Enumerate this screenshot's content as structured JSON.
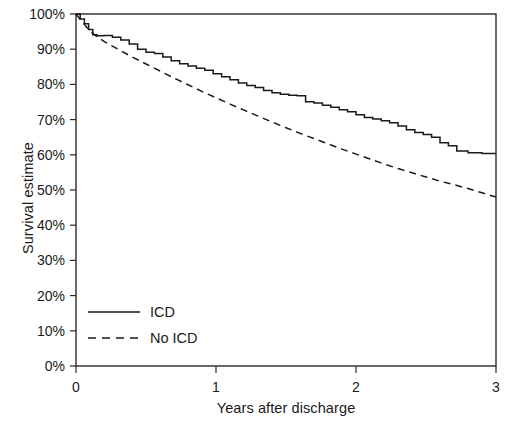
{
  "chart_data": {
    "type": "line",
    "title": "",
    "subtitle": "",
    "xlabel": "Years after discharge",
    "ylabel": "Survival estimate",
    "xlim": [
      0,
      3
    ],
    "ylim": [
      0,
      100
    ],
    "grid": false,
    "legend_position": "bottom-left",
    "xticks": [
      0,
      1,
      2,
      3
    ],
    "xtick_labels": [
      "0",
      "1",
      "2",
      "3"
    ],
    "yticks": [
      0,
      10,
      20,
      30,
      40,
      50,
      60,
      70,
      80,
      90,
      100
    ],
    "ytick_labels": [
      "0%",
      "10%",
      "20%",
      "30%",
      "40%",
      "50%",
      "60%",
      "70%",
      "80%",
      "90%",
      "100%"
    ],
    "series": [
      {
        "name": "ICD",
        "style": "solid",
        "color": "#1a1a1a",
        "x": [
          0.0,
          0.03,
          0.06,
          0.09,
          0.12,
          0.15,
          0.2,
          0.26,
          0.32,
          0.38,
          0.44,
          0.5,
          0.56,
          0.62,
          0.68,
          0.74,
          0.8,
          0.86,
          0.92,
          0.98,
          1.04,
          1.1,
          1.16,
          1.22,
          1.28,
          1.34,
          1.4,
          1.46,
          1.52,
          1.58,
          1.64,
          1.7,
          1.76,
          1.82,
          1.88,
          1.94,
          2.0,
          2.06,
          2.12,
          2.18,
          2.24,
          2.3,
          2.36,
          2.42,
          2.48,
          2.54,
          2.6,
          2.66,
          2.72,
          2.8,
          2.9,
          3.0
        ],
        "y": [
          100.0,
          98.6,
          97.2,
          95.6,
          94.1,
          93.8,
          93.9,
          93.4,
          92.6,
          91.5,
          90.0,
          89.1,
          88.8,
          87.8,
          86.7,
          85.9,
          85.2,
          84.6,
          84.0,
          83.0,
          82.2,
          81.3,
          80.4,
          79.7,
          79.1,
          78.3,
          77.6,
          77.2,
          76.9,
          76.8,
          75.1,
          74.7,
          74.1,
          73.5,
          72.8,
          72.2,
          71.4,
          70.6,
          70.2,
          69.7,
          69.1,
          68.2,
          67.1,
          66.3,
          65.8,
          65.0,
          63.4,
          62.6,
          61.1,
          60.6,
          60.4,
          60.4
        ]
      },
      {
        "name": "No ICD",
        "style": "dashed",
        "color": "#1a1a1a",
        "x": [
          0.0,
          0.05,
          0.1,
          0.15,
          0.2,
          0.3,
          0.4,
          0.5,
          0.6,
          0.7,
          0.8,
          0.9,
          1.0,
          1.1,
          1.2,
          1.3,
          1.4,
          1.5,
          1.6,
          1.7,
          1.8,
          1.9,
          2.0,
          2.1,
          2.2,
          2.3,
          2.4,
          2.5,
          2.6,
          2.7,
          2.8,
          2.9,
          3.0
        ],
        "y": [
          100.0,
          97.5,
          95.1,
          93.6,
          92.2,
          90.0,
          87.8,
          85.8,
          83.8,
          81.8,
          79.9,
          78.0,
          76.2,
          74.4,
          72.7,
          71.0,
          69.3,
          67.7,
          66.1,
          64.6,
          63.1,
          61.6,
          60.2,
          58.8,
          57.4,
          56.1,
          54.9,
          53.7,
          52.5,
          51.5,
          50.4,
          49.2,
          48.0
        ]
      }
    ],
    "annotations": [],
    "reference_points": {
      "icd_at_year_1": 82.2,
      "icd_at_year_2": 71.4,
      "icd_at_year_3": 60.4,
      "no_icd_at_year_1": 76.2,
      "no_icd_at_year_2": 60.2,
      "no_icd_at_year_3": 48.0
    }
  },
  "legend": {
    "items": [
      {
        "label": "ICD",
        "style": "solid"
      },
      {
        "label": "No ICD",
        "style": "dashed"
      }
    ]
  },
  "colors": {
    "axis": "#1a1a1a",
    "background": "#ffffff",
    "curve": "#1a1a1a"
  }
}
